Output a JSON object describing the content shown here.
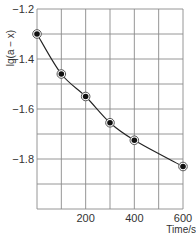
{
  "chart_data": {
    "type": "line",
    "title": "",
    "xlabel": "Time/s",
    "ylabel": "lg(a − x)",
    "xlim": [
      0,
      600
    ],
    "ylim": [
      -2.0,
      -1.2
    ],
    "grid": true,
    "x_ticks": [
      200,
      400,
      600
    ],
    "x_tick_labels": [
      "200",
      "400",
      "600"
    ],
    "y_ticks": [
      -1.2,
      -1.4,
      -1.6,
      -1.8
    ],
    "y_tick_labels": [
      "-1.2",
      "-1.4",
      "-1.6",
      "-1.8"
    ],
    "x_grid_step": 100,
    "y_grid_step": 0.1,
    "series": [
      {
        "name": "lg(a-x) vs time",
        "marker": "circle",
        "x": [
          0,
          100,
          200,
          300,
          400,
          600
        ],
        "values": [
          -1.3,
          -1.46,
          -1.55,
          -1.655,
          -1.725,
          -1.83
        ]
      }
    ]
  },
  "colors": {
    "grid": "#8a8a8a",
    "line": "#222222",
    "marker": "#111111"
  }
}
